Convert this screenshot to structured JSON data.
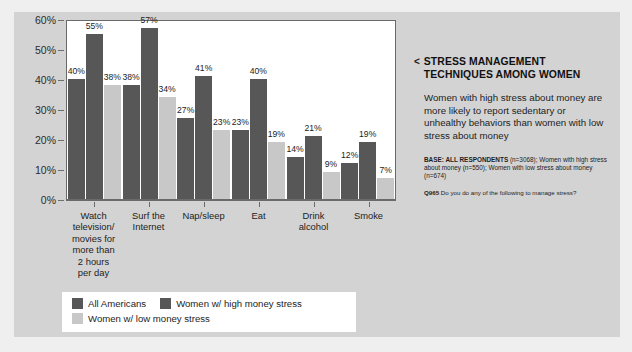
{
  "chart_data": {
    "type": "bar",
    "title": "",
    "xlabel": "",
    "ylabel": "",
    "ylim": [
      0,
      60
    ],
    "grid": false,
    "legend_position": "bottom-left",
    "ytick_labels": [
      "60%",
      "50%",
      "40%",
      "30%",
      "20%",
      "10%",
      "0%"
    ],
    "ytick_values": [
      60,
      50,
      40,
      30,
      20,
      10,
      0
    ],
    "categories": [
      "Watch television/ movies for more than 2 hours per day",
      "Surf the Internet",
      "Nap/sleep",
      "Eat",
      "Drink alcohol",
      "Smoke"
    ],
    "category_lines": [
      [
        "Watch",
        "television/",
        "movies for",
        "more than",
        "2 hours",
        "per day"
      ],
      [
        "Surf the",
        "Internet"
      ],
      [
        "Nap/sleep"
      ],
      [
        "Eat"
      ],
      [
        "Drink",
        "alcohol"
      ],
      [
        "Smoke"
      ]
    ],
    "series": [
      {
        "name": "All Americans",
        "color": "#575757",
        "values": [
          40,
          38,
          27,
          23,
          14,
          12
        ],
        "labels": [
          "40%",
          "38%",
          "27%",
          "23%",
          "14%",
          "12%"
        ]
      },
      {
        "name": "Women w/ high money stress",
        "color": "#575757",
        "values": [
          55,
          57,
          41,
          40,
          21,
          19
        ],
        "labels": [
          "55%",
          "57%",
          "41%",
          "40%",
          "21%",
          "19%"
        ]
      },
      {
        "name": "Women w/ low money stress",
        "color": "#c8c8c8",
        "values": [
          38,
          34,
          23,
          19,
          9,
          7
        ],
        "labels": [
          "38%",
          "34%",
          "23%",
          "19%",
          "9%",
          "7%"
        ]
      }
    ]
  },
  "panel": {
    "chevron": "<",
    "title": "STRESS MANAGEMENT TECHNIQUES AMONG WOMEN",
    "deck": "Women with high stress about money are more likely to report sedentary or unhealthy behaviors than women with low stress about money",
    "base_label": "BASE: ALL RESPONDENTS",
    "base_text": " (n=3068); Women with high stress about money (n=550); Women with low stress about money (n=674)",
    "question_code": "Q965",
    "question_text": " Do you do any of the following to manage stress?"
  },
  "colors": {
    "slide_background": "#d3d3d3",
    "page_background": "#efefef",
    "plot_background": "#ffffff",
    "series_dark": "#575757",
    "series_light": "#c8c8c8",
    "axis": "#6a6a6a",
    "text": "#1d1d1d"
  }
}
